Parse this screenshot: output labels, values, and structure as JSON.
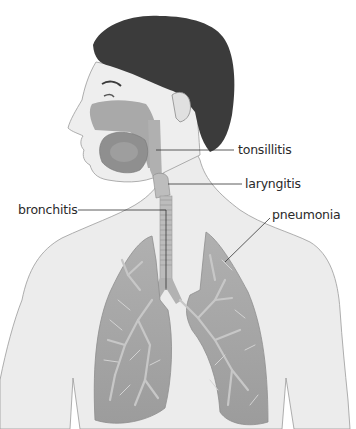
{
  "diagram": {
    "style": "grayscale illustration",
    "labels": [
      {
        "id": "tonsillitis",
        "text": "tonsillitis"
      },
      {
        "id": "laryngitis",
        "text": "laryngitis"
      },
      {
        "id": "bronchitis",
        "text": "bronchitis"
      },
      {
        "id": "pneumonia",
        "text": "pneumonia"
      }
    ],
    "colors": {
      "background": "#ffffff",
      "skin": "#e9e9e9",
      "outline": "#9a9a9a",
      "hair": "#3a3a3a",
      "airway": "#b5b5b5",
      "lung": "#a3a3a3",
      "lung_light": "#c4c4c4",
      "leader_line": "#333333"
    }
  }
}
